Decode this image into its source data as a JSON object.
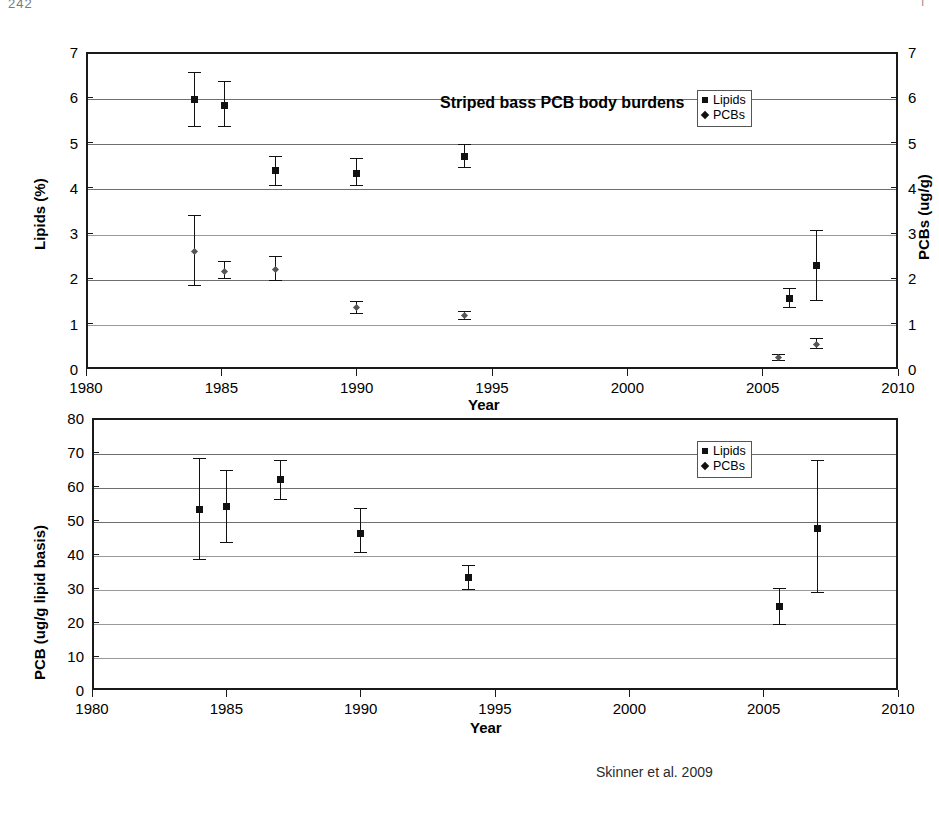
{
  "page": {
    "corner_left": "242",
    "corner_right": "|"
  },
  "caption": "Skinner et al. 2009",
  "legend": {
    "items": [
      {
        "label": "Lipids",
        "marker": "square-marker-icon"
      },
      {
        "label": "PCBs",
        "marker": "diamond-marker-icon"
      }
    ]
  },
  "chart_data": [
    {
      "type": "scatter",
      "id": "top",
      "title": "Striped bass PCB body burdens",
      "xlabel": "Year",
      "ylabel": "Lipids (%)",
      "y2label": "PCBs (ug/g)",
      "xlim": [
        1980,
        2010
      ],
      "ylim": [
        0,
        7
      ],
      "y2lim": [
        0,
        7
      ],
      "xticks": [
        1980,
        1985,
        1990,
        1995,
        2000,
        2005,
        2010
      ],
      "yticks": [
        0,
        1,
        2,
        3,
        4,
        5,
        6,
        7
      ],
      "y2ticks": [
        0,
        1,
        2,
        3,
        4,
        5,
        6,
        7
      ],
      "grid": true,
      "legend_position": "top-right",
      "series": [
        {
          "name": "Lipids",
          "axis": "left",
          "marker": "square",
          "points": [
            {
              "x": 1984.0,
              "y": 5.95,
              "err_low": 5.35,
              "err_high": 6.55
            },
            {
              "x": 1985.1,
              "y": 5.82,
              "err_low": 5.35,
              "err_high": 6.35
            },
            {
              "x": 1987.0,
              "y": 4.38,
              "err_low": 4.05,
              "err_high": 4.7
            },
            {
              "x": 1990.0,
              "y": 4.32,
              "err_low": 4.05,
              "err_high": 4.65
            },
            {
              "x": 1994.0,
              "y": 4.7,
              "err_low": 4.45,
              "err_high": 4.95
            },
            {
              "x": 2006.0,
              "y": 1.55,
              "err_low": 1.35,
              "err_high": 1.78
            },
            {
              "x": 2007.0,
              "y": 2.28,
              "err_low": 1.52,
              "err_high": 3.05
            }
          ]
        },
        {
          "name": "PCBs",
          "axis": "right",
          "marker": "diamond",
          "points": [
            {
              "x": 1984.0,
              "y": 2.6,
              "err_low": 1.85,
              "err_high": 3.38
            },
            {
              "x": 1985.1,
              "y": 2.15,
              "err_low": 2.0,
              "err_high": 2.38
            },
            {
              "x": 1987.0,
              "y": 2.2,
              "err_low": 1.95,
              "err_high": 2.48
            },
            {
              "x": 1990.0,
              "y": 1.35,
              "err_low": 1.22,
              "err_high": 1.48
            },
            {
              "x": 1994.0,
              "y": 1.18,
              "err_low": 1.1,
              "err_high": 1.28
            },
            {
              "x": 2005.6,
              "y": 0.25,
              "err_low": 0.18,
              "err_high": 0.32
            },
            {
              "x": 2007.0,
              "y": 0.55,
              "err_low": 0.45,
              "err_high": 0.68
            }
          ]
        }
      ]
    },
    {
      "type": "scatter",
      "id": "bottom",
      "title": "",
      "xlabel": "Year",
      "ylabel": "PCB (ug/g lipid basis)",
      "xlim": [
        1980,
        2010
      ],
      "ylim": [
        0,
        80
      ],
      "xticks": [
        1980,
        1985,
        1990,
        1995,
        2000,
        2005,
        2010
      ],
      "yticks": [
        0,
        10,
        20,
        30,
        40,
        50,
        60,
        70,
        80
      ],
      "grid": true,
      "legend_position": "top-right",
      "series": [
        {
          "name": "Lipids",
          "axis": "left",
          "marker": "square",
          "points": [
            {
              "x": 1984.0,
              "y": 53.0,
              "err_low": 38.5,
              "err_high": 68.0
            },
            {
              "x": 1985.0,
              "y": 54.0,
              "err_low": 43.5,
              "err_high": 64.5
            },
            {
              "x": 1987.0,
              "y": 62.0,
              "err_low": 56.0,
              "err_high": 67.5
            },
            {
              "x": 1990.0,
              "y": 46.0,
              "err_low": 40.5,
              "err_high": 53.5
            },
            {
              "x": 1994.0,
              "y": 33.0,
              "err_low": 29.5,
              "err_high": 36.5
            },
            {
              "x": 2005.6,
              "y": 24.7,
              "err_low": 19.2,
              "err_high": 30.0
            },
            {
              "x": 2007.0,
              "y": 47.5,
              "err_low": 28.8,
              "err_high": 67.5
            }
          ]
        }
      ]
    }
  ]
}
